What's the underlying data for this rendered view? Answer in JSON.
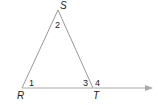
{
  "diagram": {
    "type": "triangle-exterior-angle",
    "colors": {
      "line": "#999999",
      "arrow": "#aaaaaa",
      "text": "#222222"
    },
    "vertices": {
      "S": {
        "label": "S",
        "x": 58,
        "y": 10
      },
      "R": {
        "label": "R",
        "x": 22,
        "y": 88
      },
      "T": {
        "label": "T",
        "x": 93,
        "y": 88
      }
    },
    "angles": [
      {
        "label": "1",
        "at": "R"
      },
      {
        "label": "2",
        "at": "S"
      },
      {
        "label": "3",
        "at": "T",
        "side": "interior"
      },
      {
        "label": "4",
        "at": "T",
        "side": "exterior"
      }
    ],
    "ray": {
      "from": "R",
      "through": "T",
      "arrow": true
    }
  }
}
